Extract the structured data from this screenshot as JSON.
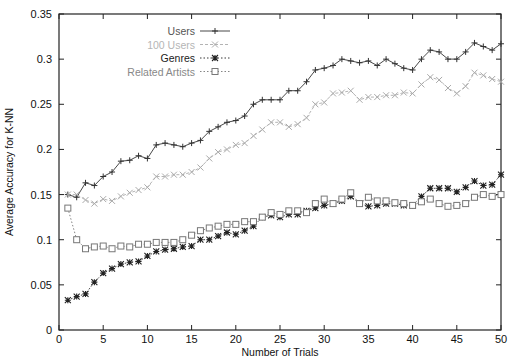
{
  "chart_data": {
    "type": "line",
    "title": "",
    "xlabel": "Number of Trials",
    "ylabel": "Average Accuracy for K-NN",
    "xlim": [
      0,
      50
    ],
    "ylim": [
      0,
      0.35
    ],
    "xticks": [
      0,
      5,
      10,
      15,
      20,
      25,
      30,
      35,
      40,
      45,
      50
    ],
    "yticks": [
      0,
      0.05,
      0.1,
      0.15,
      0.2,
      0.25,
      0.3,
      0.35
    ],
    "xtick_labels": [
      "0",
      "5",
      "10",
      "15",
      "20",
      "25",
      "30",
      "35",
      "40",
      "45",
      "50"
    ],
    "ytick_labels": [
      "0",
      "0.05",
      "0.1",
      "0.15",
      "0.2",
      "0.25",
      "0.3",
      "0.35"
    ],
    "grid": false,
    "legend_position": "top-center-inside",
    "x": [
      1,
      2,
      3,
      4,
      5,
      6,
      7,
      8,
      9,
      10,
      11,
      12,
      13,
      14,
      15,
      16,
      17,
      18,
      19,
      20,
      21,
      22,
      23,
      24,
      25,
      26,
      27,
      28,
      29,
      30,
      31,
      32,
      33,
      34,
      35,
      36,
      37,
      38,
      39,
      40,
      41,
      42,
      43,
      44,
      45,
      46,
      47,
      48,
      49,
      50
    ],
    "series": [
      {
        "name": "Users",
        "color": "#333333",
        "marker": "plus",
        "dash": "solid",
        "values": [
          0.15,
          0.147,
          0.163,
          0.16,
          0.17,
          0.175,
          0.187,
          0.188,
          0.193,
          0.19,
          0.205,
          0.207,
          0.205,
          0.203,
          0.207,
          0.21,
          0.22,
          0.225,
          0.23,
          0.232,
          0.237,
          0.25,
          0.255,
          0.255,
          0.255,
          0.265,
          0.265,
          0.275,
          0.288,
          0.29,
          0.293,
          0.3,
          0.298,
          0.296,
          0.298,
          0.293,
          0.3,
          0.295,
          0.29,
          0.288,
          0.3,
          0.31,
          0.308,
          0.3,
          0.3,
          0.308,
          0.318,
          0.314,
          0.31,
          0.317
        ]
      },
      {
        "name": "100 Users",
        "color": "#aaaaaa",
        "marker": "cross",
        "dash": "dashed",
        "values": [
          0.15,
          0.15,
          0.144,
          0.14,
          0.145,
          0.143,
          0.148,
          0.152,
          0.155,
          0.158,
          0.17,
          0.17,
          0.172,
          0.172,
          0.175,
          0.18,
          0.19,
          0.197,
          0.2,
          0.205,
          0.207,
          0.215,
          0.222,
          0.23,
          0.23,
          0.225,
          0.228,
          0.235,
          0.25,
          0.252,
          0.262,
          0.263,
          0.265,
          0.255,
          0.258,
          0.258,
          0.26,
          0.26,
          0.263,
          0.262,
          0.272,
          0.28,
          0.277,
          0.268,
          0.262,
          0.27,
          0.285,
          0.282,
          0.278,
          0.275
        ]
      },
      {
        "name": "Genres",
        "color": "#222222",
        "marker": "star",
        "dash": "dotted",
        "values": [
          0.033,
          0.037,
          0.04,
          0.053,
          0.063,
          0.068,
          0.073,
          0.075,
          0.076,
          0.082,
          0.087,
          0.089,
          0.09,
          0.092,
          0.093,
          0.1,
          0.1,
          0.104,
          0.108,
          0.106,
          0.11,
          0.115,
          0.125,
          0.127,
          0.125,
          0.128,
          0.128,
          0.132,
          0.135,
          0.138,
          0.14,
          0.143,
          0.148,
          0.14,
          0.137,
          0.138,
          0.14,
          0.14,
          0.138,
          0.138,
          0.148,
          0.157,
          0.157,
          0.157,
          0.153,
          0.158,
          0.165,
          0.16,
          0.161,
          0.172
        ]
      },
      {
        "name": "Related Artists",
        "color": "#777777",
        "marker": "square",
        "dash": "dotted",
        "values": [
          0.135,
          0.1,
          0.09,
          0.092,
          0.093,
          0.09,
          0.093,
          0.092,
          0.095,
          0.095,
          0.097,
          0.097,
          0.097,
          0.1,
          0.105,
          0.11,
          0.113,
          0.115,
          0.117,
          0.117,
          0.12,
          0.12,
          0.125,
          0.13,
          0.128,
          0.132,
          0.132,
          0.13,
          0.14,
          0.145,
          0.14,
          0.145,
          0.152,
          0.14,
          0.147,
          0.143,
          0.143,
          0.141,
          0.14,
          0.138,
          0.142,
          0.145,
          0.14,
          0.137,
          0.138,
          0.14,
          0.147,
          0.15,
          0.148,
          0.15
        ]
      }
    ]
  },
  "legend": {
    "items": [
      {
        "label": "Users",
        "color": "#555555"
      },
      {
        "label": "100 Users",
        "color": "#b5b5b5"
      },
      {
        "label": "Genres",
        "color": "#222222"
      },
      {
        "label": "Related Artists",
        "color": "#888888"
      }
    ]
  }
}
